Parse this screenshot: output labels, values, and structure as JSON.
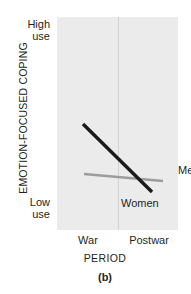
{
  "figure": {
    "caption": "(b)",
    "background_color": "#ffffff",
    "panel_color": "#ebebeb",
    "divider_color": "#d2d2d2"
  },
  "axes": {
    "y_title": "EMOTION-FOCUSED COPING",
    "y_ticks": [
      {
        "line1": "High",
        "line2": "use"
      },
      {
        "line1": "Low",
        "line2": "use"
      }
    ],
    "x_title": "PERIOD",
    "x_ticks": [
      "War",
      "Postwar"
    ]
  },
  "chart_data": {
    "type": "line",
    "title": "",
    "subtitle": "",
    "xlabel": "PERIOD",
    "ylabel": "EMOTION-FOCUSED COPING",
    "categories": [
      "War",
      "Postwar"
    ],
    "x": [
      0,
      1
    ],
    "xlim": [
      -0.45,
      1.5
    ],
    "ylim": [
      0,
      1
    ],
    "ytick_labels": [
      "Low use",
      "High use"
    ],
    "ytick_values": [
      0,
      1
    ],
    "grid": false,
    "legend": "inline-annotations",
    "annotations": [
      {
        "text": "Men",
        "x": 0.92,
        "y": 0.42,
        "color": "#1a1a1a"
      },
      {
        "text": "Women",
        "x": 0.08,
        "y": 0.25,
        "color": "#1a1a1a"
      }
    ],
    "series": [
      {
        "name": "Men",
        "color": "#1a1a1a",
        "line_width": 3.4,
        "values": [
          0.82,
          0.5
        ],
        "pixel_endpoints": [
          [
            83,
            124
          ],
          [
            152,
            192
          ]
        ]
      },
      {
        "name": "Women",
        "color": "#9c9c9c",
        "line_width": 2.6,
        "values": [
          0.58,
          0.555
        ],
        "pixel_endpoints": [
          [
            84,
            174
          ],
          [
            163,
            181
          ]
        ]
      }
    ]
  },
  "series_labels": {
    "men": "Men",
    "women": "Women"
  }
}
